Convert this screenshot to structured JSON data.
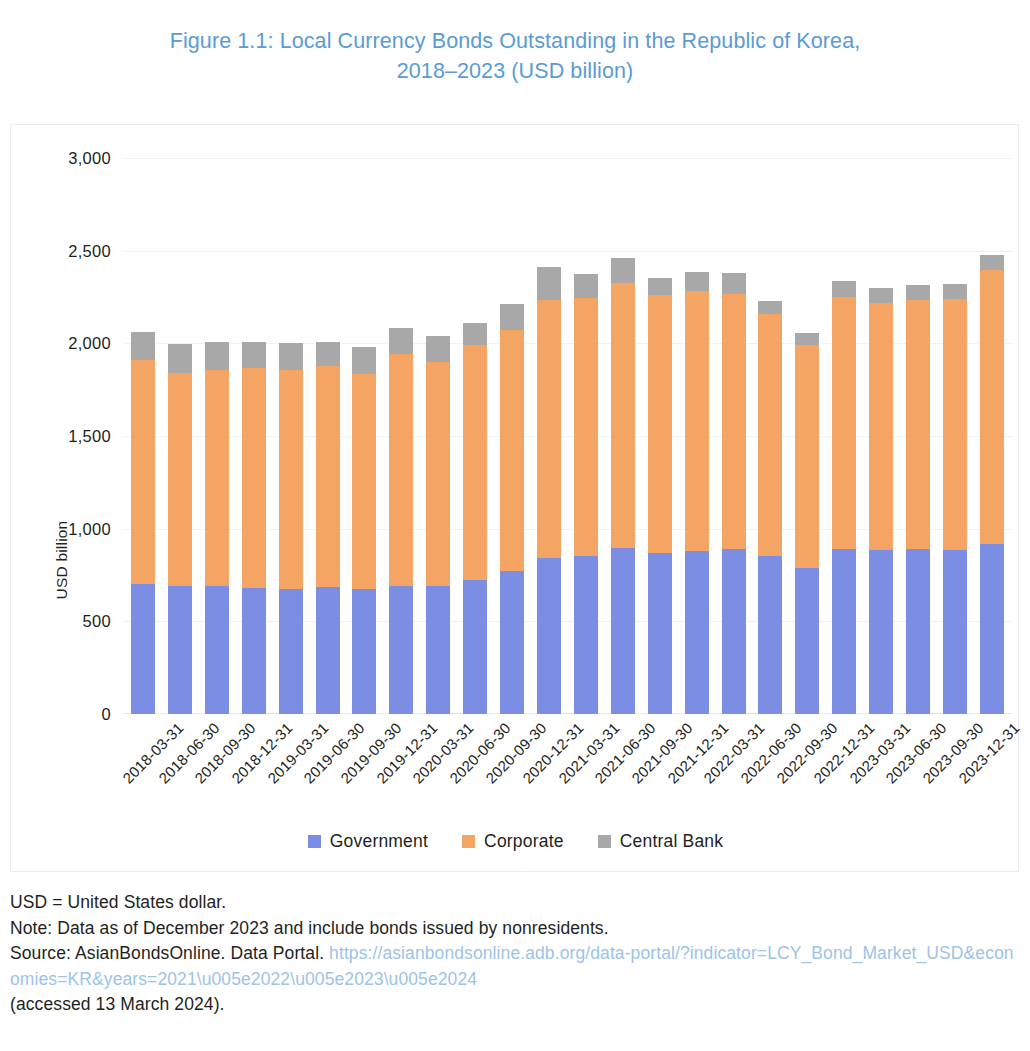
{
  "figure": {
    "title_line1": "Figure 1.1: Local Currency Bonds Outstanding in the Republic of Korea,",
    "title_line2": "2018–2023 (USD billion)",
    "title_color": "#5b9bd5"
  },
  "footnotes": {
    "abbreviation": "USD = United States dollar.",
    "note": "Note: Data as of December 2023 and include bonds issued by nonresidents.",
    "source_prefix": "Source: AsianBondsOnline. Data Portal.",
    "source_url": "https://asianbondsonline.adb.org/data-portal/?indicator=LCY_Bond_Market_USD&economies=KR&years=2021\\u005e2022\\u005e2023\\u005e2024",
    "accessed": "(accessed 13 March 2024)."
  },
  "chart_data": {
    "type": "bar",
    "subtype": "stacked-vertical",
    "title": "Figure 1.1: Local Currency Bonds Outstanding in the Republic of Korea, 2018–2023 (USD billion)",
    "xlabel": "",
    "ylabel": "USD billion",
    "ylim": [
      0,
      3000
    ],
    "yticks": [
      0,
      500,
      1000,
      1500,
      2000,
      2500,
      3000
    ],
    "ytick_labels": [
      "0",
      "500",
      "1,000",
      "1,500",
      "2,000",
      "2,500",
      "3,000"
    ],
    "grid": true,
    "legend_position": "bottom",
    "colors": {
      "Government": "#7b8ee4",
      "Corporate": "#f4a463",
      "Central Bank": "#a8a8a8"
    },
    "categories": [
      "2018-03-31",
      "2018-06-30",
      "2018-09-30",
      "2018-12-31",
      "2019-03-31",
      "2019-06-30",
      "2019-09-30",
      "2019-12-31",
      "2020-03-31",
      "2020-06-30",
      "2020-09-30",
      "2020-12-31",
      "2021-03-31",
      "2021-06-30",
      "2021-09-30",
      "2021-12-31",
      "2022-03-31",
      "2022-06-30",
      "2022-09-30",
      "2022-12-31",
      "2023-03-31",
      "2023-06-30",
      "2023-09-30",
      "2023-12-31"
    ],
    "series": [
      {
        "name": "Government",
        "color": "#7b8ee4",
        "values": [
          702,
          690,
          692,
          680,
          676,
          685,
          672,
          692,
          690,
          725,
          770,
          840,
          855,
          895,
          870,
          880,
          890,
          855,
          790,
          890,
          885,
          890,
          885,
          915
        ]
      },
      {
        "name": "Corporate",
        "color": "#f4a463",
        "values": [
          1209,
          1152,
          1165,
          1185,
          1180,
          1195,
          1165,
          1250,
          1210,
          1265,
          1300,
          1395,
          1390,
          1430,
          1390,
          1400,
          1375,
          1305,
          1200,
          1360,
          1335,
          1345,
          1355,
          1480
        ]
      },
      {
        "name": "Central Bank",
        "color": "#a8a8a8",
        "values": [
          151,
          153,
          150,
          142,
          145,
          125,
          142,
          140,
          137,
          122,
          140,
          175,
          130,
          135,
          95,
          105,
          115,
          68,
          65,
          85,
          78,
          78,
          82,
          80
        ]
      }
    ],
    "totals": [
      2062,
      1995,
      2007,
      2007,
      2001,
      2005,
      1979,
      2082,
      2037,
      2112,
      2210,
      2410,
      2375,
      2460,
      2355,
      2385,
      2380,
      2228,
      2055,
      2335,
      2298,
      2313,
      2322,
      2475
    ]
  },
  "legend": [
    {
      "label": "Government",
      "swatch": "gov"
    },
    {
      "label": "Corporate",
      "swatch": "corp"
    },
    {
      "label": "Central Bank",
      "swatch": "cb"
    }
  ]
}
